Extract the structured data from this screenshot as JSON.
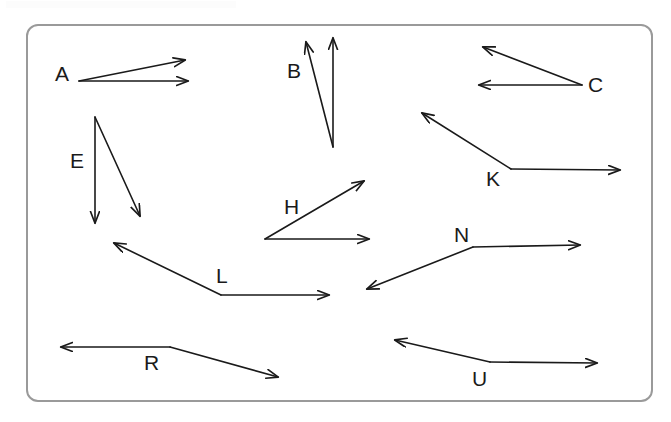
{
  "page": {
    "width": 671,
    "height": 422,
    "background_color": "#ffffff"
  },
  "frame": {
    "name": "angle-diagram-frame",
    "x": 26,
    "y": 24,
    "width": 627,
    "height": 378,
    "border_color": "#9a9a9a",
    "border_width": 2,
    "corner_radius": 12,
    "fill": "#ffffff"
  },
  "style": {
    "stroke_color": "#1a1a1a",
    "stroke_width": 1.6,
    "label_color": "#1a1a1a",
    "label_font_size": 21
  },
  "diagram": {
    "type": "angles",
    "count": 12,
    "angles": [
      {
        "label": "A",
        "vertex": [
          79,
          81
        ],
        "label_pos": [
          55,
          63
        ],
        "rays": [
          {
            "tip": [
              185,
              60
            ],
            "arrow": true
          },
          {
            "tip": [
              188,
              81
            ],
            "arrow": true
          }
        ]
      },
      {
        "label": "B",
        "vertex": [
          333,
          147
        ],
        "label_pos": [
          287,
          60
        ],
        "rays": [
          {
            "tip": [
              306,
              42
            ],
            "arrow": true
          },
          {
            "tip": [
              333,
              38
            ],
            "arrow": true
          }
        ]
      },
      {
        "label": "C",
        "vertex": [
          582,
          85
        ],
        "label_pos": [
          588,
          74
        ],
        "rays": [
          {
            "tip": [
              483,
              47
            ],
            "arrow": true
          },
          {
            "tip": [
              479,
              85
            ],
            "arrow": true
          }
        ]
      },
      {
        "label": "E",
        "vertex": [
          95,
          117
        ],
        "label_pos": [
          70,
          150
        ],
        "rays": [
          {
            "tip": [
              95,
              223
            ],
            "arrow": true
          },
          {
            "tip": [
              140,
              216
            ],
            "arrow": true
          }
        ]
      },
      {
        "label": "H",
        "vertex": [
          265,
          239
        ],
        "label_pos": [
          284,
          196
        ],
        "rays": [
          {
            "tip": [
              364,
              181
            ],
            "arrow": true
          },
          {
            "tip": [
              369,
              239
            ],
            "arrow": true
          }
        ]
      },
      {
        "label": "K",
        "vertex": [
          511,
          169
        ],
        "label_pos": [
          486,
          168
        ],
        "rays": [
          {
            "tip": [
              422,
              113
            ],
            "arrow": true
          },
          {
            "tip": [
              620,
              170
            ],
            "arrow": true
          }
        ]
      },
      {
        "label": "L",
        "vertex": [
          221,
          295
        ],
        "label_pos": [
          216,
          265
        ],
        "rays": [
          {
            "tip": [
              114,
              243
            ],
            "arrow": true
          },
          {
            "tip": [
              329,
              295
            ],
            "arrow": true
          }
        ]
      },
      {
        "label": "N",
        "vertex": [
          473,
          247
        ],
        "label_pos": [
          454,
          224
        ],
        "rays": [
          {
            "tip": [
              367,
              289
            ],
            "arrow": true
          },
          {
            "tip": [
              580,
              245
            ],
            "arrow": true
          }
        ]
      },
      {
        "label": "R",
        "vertex": [
          170,
          347
        ],
        "label_pos": [
          144,
          352
        ],
        "rays": [
          {
            "tip": [
              61,
              347
            ],
            "arrow": true
          },
          {
            "tip": [
              278,
              377
            ],
            "arrow": true
          }
        ]
      },
      {
        "label": "U",
        "vertex": [
          490,
          362
        ],
        "label_pos": [
          472,
          368
        ],
        "rays": [
          {
            "tip": [
              395,
              340
            ],
            "arrow": true
          },
          {
            "tip": [
              597,
              363
            ],
            "arrow": true
          }
        ]
      }
    ]
  },
  "labels": {
    "a": "A",
    "b": "B",
    "c": "C",
    "e": "E",
    "h": "H",
    "k": "K",
    "l": "L",
    "n": "N",
    "r": "R",
    "u": "U"
  }
}
